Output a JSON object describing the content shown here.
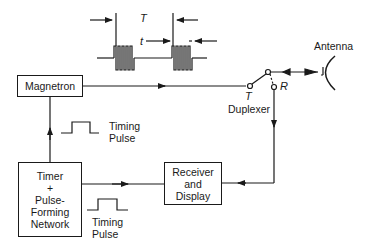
{
  "diagram": {
    "blocks": {
      "magnetron": "Magnetron",
      "timer": [
        "Timer",
        "+",
        "Pulse-",
        "Forming",
        "Network"
      ],
      "receiver": [
        "Receiver",
        "and",
        "Display"
      ]
    },
    "labels": {
      "antenna": "Antenna",
      "duplexer": "Duplexer",
      "duplexer_t": "T",
      "duplexer_r": "R",
      "period": "T",
      "pulse_width": "t",
      "timing_pulse_1": [
        "Timing",
        "Pulse"
      ],
      "timing_pulse_2": [
        "Timing",
        "Pulse"
      ]
    },
    "colors": {
      "line": "#1a1a1a",
      "background": "#ffffff"
    }
  }
}
